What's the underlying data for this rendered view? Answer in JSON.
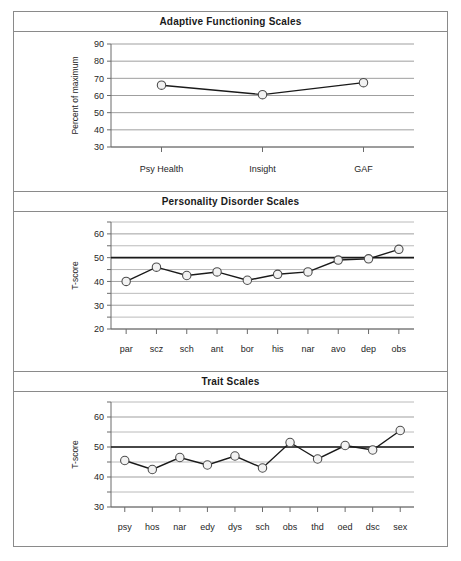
{
  "figure": {
    "panels": [
      {
        "id": "adaptive-functioning",
        "title": "Adaptive Functioning Scales",
        "ylabel": "Percent of maximum"
      },
      {
        "id": "personality-disorder",
        "title": "Personality Disorder Scales",
        "ylabel": "T-score"
      },
      {
        "id": "trait-scales",
        "title": "Trait Scales",
        "ylabel": "T-score"
      }
    ]
  },
  "chart_data": [
    {
      "type": "line",
      "title": "Adaptive Functioning Scales",
      "xlabel": "",
      "ylabel": "Percent of maximum",
      "categories": [
        "Psy Health",
        "Insight",
        "GAF"
      ],
      "values": [
        66,
        60.5,
        67.5
      ],
      "ylim": [
        30,
        90
      ],
      "yticks": [
        30,
        40,
        50,
        60,
        70,
        80,
        90
      ],
      "ytick_labels": [
        "30",
        "40",
        "50",
        "60",
        "70",
        "80",
        "90"
      ],
      "grid": true,
      "gridline_interval": 10,
      "reference_line": null,
      "marker": "open-circle",
      "legend": "none"
    },
    {
      "type": "line",
      "title": "Personality Disorder Scales",
      "xlabel": "",
      "ylabel": "T-score",
      "categories": [
        "par",
        "scz",
        "sch",
        "ant",
        "bor",
        "his",
        "nar",
        "avo",
        "dep",
        "obs"
      ],
      "values": [
        40,
        46,
        42.5,
        44,
        40.5,
        43,
        44,
        49,
        49.5,
        53.5
      ],
      "ylim": [
        20,
        65
      ],
      "yticks": [
        20,
        25,
        30,
        35,
        40,
        45,
        50,
        55,
        60,
        65
      ],
      "ytick_labels": [
        "20",
        "",
        "30",
        "",
        "40",
        "",
        "50",
        "",
        "60",
        ""
      ],
      "grid": true,
      "gridline_interval": 5,
      "reference_line": 50,
      "marker": "open-circle",
      "legend": "none"
    },
    {
      "type": "line",
      "title": "Trait Scales",
      "xlabel": "",
      "ylabel": "T-score",
      "categories": [
        "psy",
        "hos",
        "nar",
        "edy",
        "dys",
        "sch",
        "obs",
        "thd",
        "oed",
        "dsc",
        "sex"
      ],
      "values": [
        45.5,
        42.5,
        46.5,
        44,
        47,
        43,
        51.5,
        46,
        50.5,
        49,
        55.5
      ],
      "ylim": [
        30,
        65
      ],
      "yticks": [
        30,
        35,
        40,
        45,
        50,
        55,
        60,
        65
      ],
      "ytick_labels": [
        "30",
        "",
        "40",
        "",
        "50",
        "",
        "60",
        ""
      ],
      "grid": true,
      "gridline_interval": 5,
      "reference_line": 50,
      "marker": "open-circle",
      "legend": "none"
    }
  ],
  "colors": {
    "frame": "#8a8a8a",
    "gridline": "#a8a8a8",
    "reference_line": "#1a1a1a",
    "series_line": "#1a1a1a",
    "marker_fill": "#f2f2f2",
    "marker_stroke": "#4d4d4d",
    "text": "#1a1a1a"
  }
}
